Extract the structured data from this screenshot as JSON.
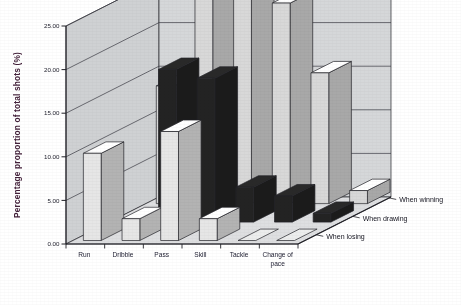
{
  "chart_data": {
    "type": "bar",
    "variant": "3d-column",
    "title": "",
    "xlabel": "",
    "ylabel": "Percentage proportion of total shots (%)",
    "ylim": [
      0,
      25
    ],
    "yticks": [
      "0.00",
      "5.00",
      "10.00",
      "15.00",
      "20.00",
      "25.00"
    ],
    "ytick_values": [
      0,
      5,
      10,
      15,
      20,
      25
    ],
    "grid": true,
    "legend_position": "depth-axis-right",
    "categories": [
      "Run",
      "Dribble",
      "Pass",
      "Skill",
      "Tackle",
      "Change of pace"
    ],
    "series": [
      {
        "name": "When winning",
        "row": 0,
        "color": "#d8d8d8",
        "values": [
          13.5,
          26.5,
          26.5,
          23.0,
          15.0,
          1.5
        ]
      },
      {
        "name": "When drawing",
        "row": 1,
        "color": "#232323",
        "values": [
          0.0,
          17.5,
          16.5,
          4.0,
          3.0,
          1.0
        ]
      },
      {
        "name": "When losing",
        "row": 2,
        "color": "#e6e6e6",
        "values": [
          10.0,
          2.5,
          12.5,
          2.5,
          0.0,
          0.0
        ]
      }
    ]
  },
  "axis": {
    "y_title": "Percentage proportion of total shots (%)",
    "y_ticks": [
      "25.00",
      "20.00",
      "15.00",
      "10.00",
      "5.00",
      "0.00"
    ],
    "x_categories": [
      "Run",
      "Dribble",
      "Pass",
      "Skill",
      "Tackle",
      "Change of",
      "pace"
    ],
    "z_series": [
      "When winning",
      "When drawing",
      "When losing"
    ]
  },
  "colors": {
    "series_winning": "#d8d8d8",
    "series_drawing": "#232323",
    "series_losing": "#e6e6e6",
    "wall": "#d5d7d9",
    "floor": "#dedfe1",
    "outline": "#222228",
    "axis_text": "#1b1b28",
    "y_title": "#43213a",
    "page_background": "#ffffff"
  }
}
